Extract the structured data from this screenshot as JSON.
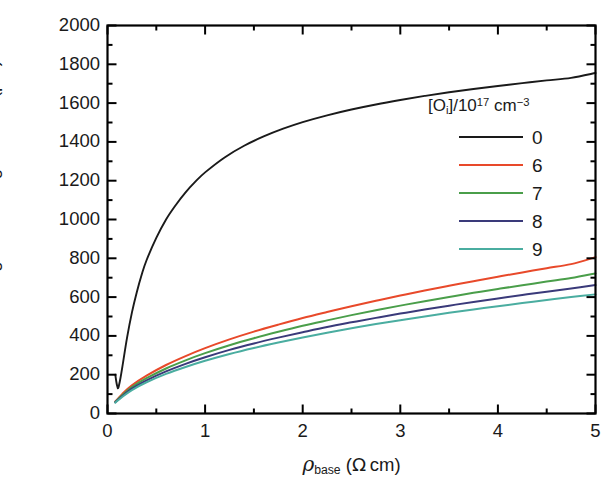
{
  "chart_data": {
    "type": "line",
    "title": "",
    "xlabel": "ρ_base (Ω cm)",
    "ylabel": "Diffusion length after degradation (μm)",
    "xlabel_parts": {
      "symbol": "ρ",
      "subscript": "base",
      "units": "(Ω cm)"
    },
    "ylabel_text": "Diffusion length after degradation (μm)",
    "xlim": [
      0,
      5
    ],
    "ylim": [
      0,
      2000
    ],
    "xticks": [
      0,
      1,
      2,
      3,
      4,
      5
    ],
    "xtick_labels": [
      "0",
      "1",
      "2",
      "3",
      "4",
      "5"
    ],
    "xminor_step": 0.5,
    "yticks": [
      0,
      200,
      400,
      600,
      800,
      1000,
      1200,
      1400,
      1600,
      1800,
      2000
    ],
    "ytick_labels": [
      "0",
      "200",
      "400",
      "600",
      "800",
      "1000",
      "1200",
      "1400",
      "1600",
      "1800",
      "2000"
    ],
    "yminor_step": 100,
    "grid": false,
    "legend_position": "upper right inside",
    "legend_title": "[Oi]/1017 cm-3",
    "legend_title_parts": {
      "bracket_open": "[O",
      "sub1": "i",
      "bracket_close": "]/10",
      "sup1": "17",
      "units": " cm",
      "sup2": "−3"
    },
    "series": [
      {
        "name": "0",
        "color": "#1a1a1a",
        "points": [
          [
            0.08,
            200
          ],
          [
            0.09,
            165
          ],
          [
            0.1,
            140
          ],
          [
            0.11,
            132
          ],
          [
            0.13,
            175
          ],
          [
            0.16,
            265
          ],
          [
            0.2,
            390
          ],
          [
            0.25,
            520
          ],
          [
            0.3,
            625
          ],
          [
            0.35,
            715
          ],
          [
            0.4,
            790
          ],
          [
            0.5,
            905
          ],
          [
            0.6,
            1000
          ],
          [
            0.7,
            1075
          ],
          [
            0.8,
            1140
          ],
          [
            0.9,
            1195
          ],
          [
            1.0,
            1243
          ],
          [
            1.2,
            1320
          ],
          [
            1.4,
            1380
          ],
          [
            1.6,
            1428
          ],
          [
            1.8,
            1468
          ],
          [
            2.0,
            1502
          ],
          [
            2.25,
            1537
          ],
          [
            2.5,
            1567
          ],
          [
            2.75,
            1593
          ],
          [
            3.0,
            1616
          ],
          [
            3.25,
            1637
          ],
          [
            3.5,
            1656
          ],
          [
            3.75,
            1673
          ],
          [
            4.0,
            1688
          ],
          [
            4.25,
            1703
          ],
          [
            4.5,
            1717
          ],
          [
            4.75,
            1730
          ],
          [
            5.0,
            1755
          ]
        ]
      },
      {
        "name": "6",
        "color": "#e8492a",
        "points": [
          [
            0.08,
            62
          ],
          [
            0.15,
            100
          ],
          [
            0.25,
            145
          ],
          [
            0.4,
            195
          ],
          [
            0.6,
            250
          ],
          [
            0.8,
            296
          ],
          [
            1.0,
            337
          ],
          [
            1.25,
            382
          ],
          [
            1.5,
            422
          ],
          [
            1.75,
            458
          ],
          [
            2.0,
            492
          ],
          [
            2.25,
            523
          ],
          [
            2.5,
            553
          ],
          [
            2.75,
            581
          ],
          [
            3.0,
            608
          ],
          [
            3.25,
            634
          ],
          [
            3.5,
            658
          ],
          [
            3.75,
            682
          ],
          [
            4.0,
            705
          ],
          [
            4.25,
            727
          ],
          [
            4.5,
            749
          ],
          [
            4.75,
            770
          ],
          [
            5.0,
            806
          ]
        ]
      },
      {
        "name": "7",
        "color": "#4a9e4a",
        "points": [
          [
            0.08,
            60
          ],
          [
            0.15,
            94
          ],
          [
            0.25,
            136
          ],
          [
            0.4,
            182
          ],
          [
            0.6,
            232
          ],
          [
            0.8,
            274
          ],
          [
            1.0,
            311
          ],
          [
            1.25,
            352
          ],
          [
            1.5,
            388
          ],
          [
            1.75,
            421
          ],
          [
            2.0,
            452
          ],
          [
            2.25,
            480
          ],
          [
            2.5,
            507
          ],
          [
            2.75,
            532
          ],
          [
            3.0,
            556
          ],
          [
            3.25,
            579
          ],
          [
            3.5,
            601
          ],
          [
            3.75,
            622
          ],
          [
            4.0,
            642
          ],
          [
            4.25,
            661
          ],
          [
            4.5,
            680
          ],
          [
            4.75,
            698
          ],
          [
            5.0,
            722
          ]
        ]
      },
      {
        "name": "8",
        "color": "#3a3a7a",
        "points": [
          [
            0.08,
            58
          ],
          [
            0.15,
            89
          ],
          [
            0.25,
            128
          ],
          [
            0.4,
            171
          ],
          [
            0.6,
            217
          ],
          [
            0.8,
            256
          ],
          [
            1.0,
            290
          ],
          [
            1.25,
            328
          ],
          [
            1.5,
            361
          ],
          [
            1.75,
            391
          ],
          [
            2.0,
            419
          ],
          [
            2.25,
            446
          ],
          [
            2.5,
            470
          ],
          [
            2.75,
            493
          ],
          [
            3.0,
            515
          ],
          [
            3.25,
            536
          ],
          [
            3.5,
            556
          ],
          [
            3.75,
            575
          ],
          [
            4.0,
            593
          ],
          [
            4.25,
            611
          ],
          [
            4.5,
            628
          ],
          [
            4.75,
            644
          ],
          [
            5.0,
            662
          ]
        ]
      },
      {
        "name": "9",
        "color": "#4aada0",
        "points": [
          [
            0.08,
            56
          ],
          [
            0.15,
            85
          ],
          [
            0.25,
            121
          ],
          [
            0.4,
            161
          ],
          [
            0.6,
            204
          ],
          [
            0.8,
            240
          ],
          [
            1.0,
            272
          ],
          [
            1.25,
            307
          ],
          [
            1.5,
            338
          ],
          [
            1.75,
            366
          ],
          [
            2.0,
            392
          ],
          [
            2.25,
            416
          ],
          [
            2.5,
            439
          ],
          [
            2.75,
            461
          ],
          [
            3.0,
            481
          ],
          [
            3.25,
            500
          ],
          [
            3.5,
            519
          ],
          [
            3.75,
            536
          ],
          [
            4.0,
            553
          ],
          [
            4.25,
            569
          ],
          [
            4.5,
            585
          ],
          [
            4.75,
            600
          ],
          [
            5.0,
            614
          ]
        ]
      }
    ]
  },
  "axes": {
    "frame_color": "#000000"
  }
}
